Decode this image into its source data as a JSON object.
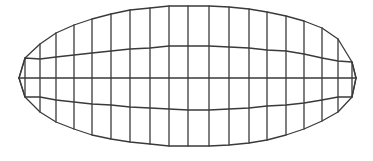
{
  "diagram": {
    "type": "structured-quad-mesh",
    "shape": "elongated ellipse / lens",
    "stroke_color": "#3a3a3a",
    "stroke_width": 1.3,
    "background": "#ffffff",
    "rows": 5,
    "columns": [
      {
        "x": 19,
        "y": [
          78,
          78,
          78,
          78,
          78
        ]
      },
      {
        "x": 25,
        "y": [
          58,
          58,
          78,
          97,
          97
        ]
      },
      {
        "x": 40,
        "y": [
          44,
          59,
          78,
          97,
          112
        ]
      },
      {
        "x": 56,
        "y": [
          33,
          57,
          78,
          100,
          122
        ]
      },
      {
        "x": 74,
        "y": [
          25,
          55,
          78,
          102,
          129
        ]
      },
      {
        "x": 92,
        "y": [
          19,
          53,
          78,
          104,
          135
        ]
      },
      {
        "x": 111,
        "y": [
          14,
          51,
          78,
          105,
          139
        ]
      },
      {
        "x": 130,
        "y": [
          10,
          49,
          78,
          107,
          142
        ]
      },
      {
        "x": 150,
        "y": [
          8,
          48,
          78,
          108,
          144
        ]
      },
      {
        "x": 169,
        "y": [
          6,
          46,
          78,
          109,
          146
        ]
      },
      {
        "x": 188,
        "y": [
          6,
          46,
          78,
          110,
          146
        ]
      },
      {
        "x": 209,
        "y": [
          6,
          46,
          78,
          110,
          146
        ]
      },
      {
        "x": 229,
        "y": [
          7,
          47,
          78,
          109,
          145
        ]
      },
      {
        "x": 249,
        "y": [
          9,
          48,
          78,
          108,
          143
        ]
      },
      {
        "x": 267,
        "y": [
          12,
          50,
          78,
          106,
          140
        ]
      },
      {
        "x": 286,
        "y": [
          16,
          51,
          78,
          105,
          135
        ]
      },
      {
        "x": 304,
        "y": [
          21,
          54,
          78,
          103,
          129
        ]
      },
      {
        "x": 322,
        "y": [
          28,
          58,
          78,
          100,
          121
        ]
      },
      {
        "x": 338,
        "y": [
          39,
          61,
          78,
          97,
          112
        ]
      },
      {
        "x": 352,
        "y": [
          62,
          62,
          78,
          97,
          97
        ]
      },
      {
        "x": 356,
        "y": [
          78,
          78,
          78,
          78,
          78
        ]
      }
    ]
  }
}
